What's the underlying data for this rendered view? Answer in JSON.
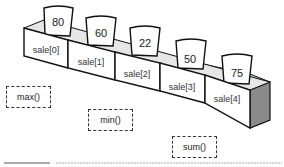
{
  "array": {
    "name": "sale",
    "cells": [
      {
        "label": "sale[0]",
        "value": "80"
      },
      {
        "label": "sale[1]",
        "value": "60"
      },
      {
        "label": "sale[2]",
        "value": "22"
      },
      {
        "label": "sale[3]",
        "value": "50"
      },
      {
        "label": "sale[4]",
        "value": "75"
      }
    ]
  },
  "functions": [
    {
      "label": "max()"
    },
    {
      "label": "min()"
    },
    {
      "label": "sum()"
    }
  ],
  "colors": {
    "stroke": "#111111",
    "inner_shade": "#c8c8c8",
    "side_shade": "#8a8a8a"
  }
}
